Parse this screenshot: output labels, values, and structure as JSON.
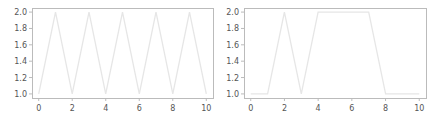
{
  "chart_data": [
    {
      "type": "line",
      "title": "",
      "xlabel": "",
      "ylabel": "",
      "x": [
        0,
        1,
        2,
        3,
        4,
        5,
        6,
        7,
        8,
        9,
        10
      ],
      "series": [
        {
          "name": "",
          "values": [
            1,
            2,
            1,
            2,
            1,
            2,
            1,
            2,
            1,
            2,
            1
          ]
        }
      ],
      "xlim": [
        -0.4,
        10.4
      ],
      "ylim": [
        0.95,
        2.05
      ],
      "xticks": [
        "0",
        "2",
        "4",
        "6",
        "8",
        "10"
      ],
      "yticks": [
        "1.0",
        "1.2",
        "1.4",
        "1.6",
        "1.8",
        "2.0"
      ],
      "grid": false,
      "line_color": "#e6e6e6",
      "frame_color": "#bbbbbb"
    },
    {
      "type": "line",
      "title": "",
      "xlabel": "",
      "ylabel": "",
      "x": [
        0,
        1,
        2,
        3,
        4,
        5,
        6,
        7,
        8,
        9,
        10
      ],
      "series": [
        {
          "name": "",
          "values": [
            1,
            1,
            2,
            1,
            2,
            2,
            2,
            2,
            1,
            1,
            1
          ]
        }
      ],
      "xlim": [
        -0.4,
        10.4
      ],
      "ylim": [
        0.95,
        2.05
      ],
      "xticks": [
        "0",
        "2",
        "4",
        "6",
        "8",
        "10"
      ],
      "yticks": [
        "1.0",
        "1.2",
        "1.4",
        "1.6",
        "1.8",
        "2.0"
      ],
      "grid": false,
      "line_color": "#e6e6e6",
      "frame_color": "#bbbbbb"
    }
  ]
}
